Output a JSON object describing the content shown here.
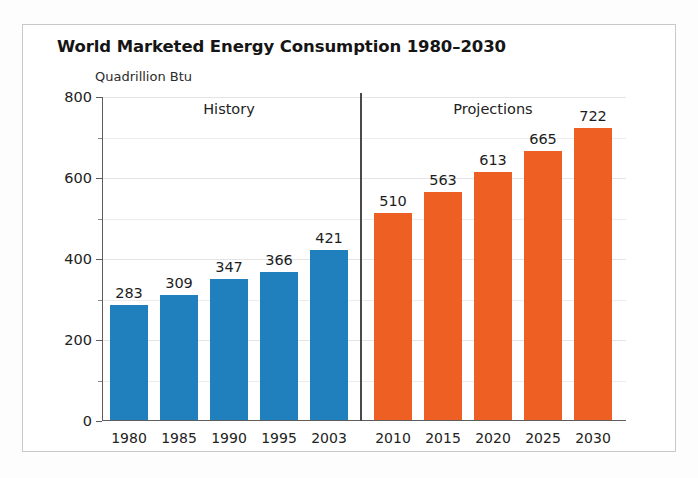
{
  "chart_data": {
    "type": "bar",
    "title": "World Marketed Energy Consumption 1980–2030",
    "subtitle": "Quadrillion Btu",
    "xlabel": "",
    "ylabel": "Quadrillion Btu",
    "ylim": [
      0,
      800
    ],
    "ytick_labels": [
      "0",
      "200",
      "400",
      "600",
      "800"
    ],
    "ytick_values": [
      0,
      200,
      400,
      600,
      800
    ],
    "minor_tick_values": [
      100,
      300,
      500,
      700
    ],
    "grid": true,
    "grid_values": [
      100,
      200,
      300,
      400,
      500,
      600,
      700,
      800
    ],
    "legend": "none",
    "categories": [
      "1980",
      "1985",
      "1990",
      "1995",
      "2003",
      "2010",
      "2015",
      "2020",
      "2025",
      "2030"
    ],
    "values": [
      283,
      309,
      347,
      366,
      421,
      510,
      563,
      613,
      665,
      722
    ],
    "value_labels": [
      "283",
      "309",
      "347",
      "366",
      "421",
      "510",
      "563",
      "613",
      "665",
      "722"
    ],
    "annotations": [
      {
        "text": "History",
        "section": "history"
      },
      {
        "text": "Projections",
        "section": "projections"
      }
    ],
    "sections": [
      {
        "name": "history",
        "caption": "History",
        "color": "#1f80bd",
        "bars": [
          {
            "category": "1980",
            "value": 283,
            "label": "283"
          },
          {
            "category": "1985",
            "value": 309,
            "label": "309"
          },
          {
            "category": "1990",
            "value": 347,
            "label": "347"
          },
          {
            "category": "1995",
            "value": 366,
            "label": "366"
          },
          {
            "category": "2003",
            "value": 421,
            "label": "421"
          }
        ]
      },
      {
        "name": "projections",
        "caption": "Projections",
        "color": "#ee5f23",
        "bars": [
          {
            "category": "2010",
            "value": 510,
            "label": "510"
          },
          {
            "category": "2015",
            "value": 563,
            "label": "563"
          },
          {
            "category": "2020",
            "value": 613,
            "label": "613"
          },
          {
            "category": "2025",
            "value": 665,
            "label": "665"
          },
          {
            "category": "2030",
            "value": 722,
            "label": "722"
          }
        ]
      }
    ],
    "colors": {
      "history_bar": "#1f80bd",
      "projection_bar": "#ee5f23",
      "axis": "#5d5d5d",
      "grid": "#ececec",
      "text": "#1d1d1d",
      "frame": "#c9c9c9",
      "background": "#ffffff"
    }
  }
}
